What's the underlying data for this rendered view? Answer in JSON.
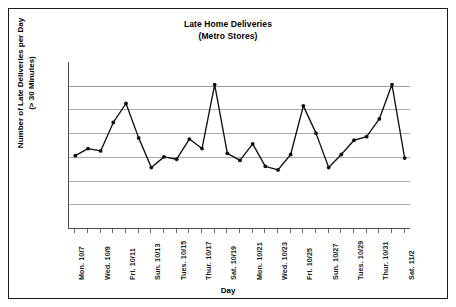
{
  "chart_data": {
    "type": "line",
    "title": "Late Home Deliveries",
    "subtitle": "(Metro Stores)",
    "xlabel": "Day",
    "ylabel_line1": "Number of Late Deliveries per Day",
    "ylabel_line2": "(> 30 Minutes)",
    "grid": true,
    "gridlines_count": 6,
    "legend": "none",
    "ylim": [
      0,
      7
    ],
    "y_tick_labels": [],
    "x": [
      "Mon. 10/7",
      "Tues. 10/8",
      "Wed. 10/9",
      "Thur. 10/10",
      "Fri. 10/11",
      "Sat. 10/12",
      "Sun. 10/13",
      "Mon. 10/14",
      "Tues. 10/15",
      "Wed. 10/16",
      "Thur. 10/17",
      "Fri. 10/18",
      "Sat. 10/19",
      "Sun. 10/20",
      "Mon. 10/21",
      "Tues. 10/22",
      "Wed. 10/23",
      "Thur. 10/24",
      "Fri. 10/25",
      "Sat. 10/26",
      "Sun. 10/27",
      "Mon. 10/28",
      "Tues. 10/29",
      "Wed. 10/30",
      "Thur. 10/31",
      "Fri. 11/1",
      "Sat. 11/2"
    ],
    "x_tick_labels_shown": [
      "Mon. 10/7",
      "Wed. 10/9",
      "Fri. 10/11",
      "Sun. 10/13",
      "Tues. 10/15",
      "Thur. 10/17",
      "Sat. 10/19",
      "Mon. 10/21",
      "Wed. 10/23",
      "Fri. 10/25",
      "Sun. 10/27",
      "Tues. 10/29",
      "Thur. 10/31",
      "Sat. 11/2"
    ],
    "values": [
      3.05,
      3.35,
      3.25,
      4.45,
      5.25,
      3.8,
      2.55,
      3.0,
      2.9,
      3.75,
      3.35,
      6.05,
      3.15,
      2.85,
      3.55,
      2.6,
      2.45,
      3.1,
      5.15,
      4.0,
      2.55,
      3.1,
      3.7,
      3.85,
      4.6,
      6.05,
      2.95
    ],
    "series_name": "Late deliveries",
    "marker": "filled-circle",
    "line_color": "#111111"
  },
  "figure": {
    "border_color": "#1a1a1a",
    "grid_color": "#a9a9a9",
    "axis_color": "#4d4d4d",
    "background": "#ffffff"
  }
}
